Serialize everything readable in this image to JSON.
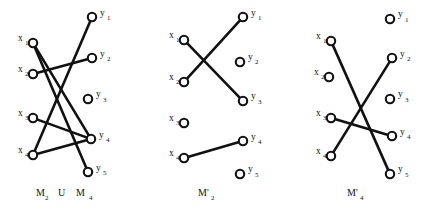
{
  "figure": {
    "background_color": "#ffffff",
    "ink_color": "#111111",
    "node_radius": 4.2,
    "panels": [
      {
        "id": "panel-union",
        "caption": "M",
        "caption_sub": "2",
        "caption_mid": "U",
        "caption2": "M",
        "caption2_sub": "4",
        "caption_full": "M2 U M4",
        "caption_x": 36,
        "caption_y": 196,
        "x_nodes": [
          {
            "label": "x",
            "sub": "1",
            "cx": 33,
            "cy": 43,
            "lx": 18,
            "ly": 41,
            "sx": 25,
            "sy": 45
          },
          {
            "label": "x",
            "sub": "2",
            "cx": 33,
            "cy": 74,
            "lx": 18,
            "ly": 72,
            "sx": 25,
            "sy": 76
          },
          {
            "label": "x",
            "sub": "3",
            "cx": 33,
            "cy": 118,
            "lx": 18,
            "ly": 116,
            "sx": 25,
            "sy": 120
          },
          {
            "label": "x",
            "sub": "4",
            "cx": 33,
            "cy": 155,
            "lx": 18,
            "ly": 153,
            "sx": 25,
            "sy": 157
          }
        ],
        "y_nodes": [
          {
            "label": "y",
            "sub": "1",
            "cx": 92,
            "cy": 17,
            "lx": 100,
            "ly": 16,
            "sx": 107,
            "sy": 20
          },
          {
            "label": "y",
            "sub": "2",
            "cx": 92,
            "cy": 58,
            "lx": 100,
            "ly": 57,
            "sx": 107,
            "sy": 61
          },
          {
            "label": "y",
            "sub": "3",
            "cx": 88,
            "cy": 99,
            "lx": 96,
            "ly": 97,
            "sx": 103,
            "sy": 102
          },
          {
            "label": "y",
            "sub": "4",
            "cx": 91,
            "cy": 139,
            "lx": 99,
            "ly": 138,
            "sx": 106,
            "sy": 142
          },
          {
            "label": "y",
            "sub": "5",
            "cx": 88,
            "cy": 172,
            "lx": 96,
            "ly": 171,
            "sx": 103,
            "sy": 175
          }
        ],
        "edges": [
          {
            "from": "x1",
            "to": "y4"
          },
          {
            "from": "x1",
            "to": "y5"
          },
          {
            "from": "x2",
            "to": "y2"
          },
          {
            "from": "x3",
            "to": "y4"
          },
          {
            "from": "x4",
            "to": "y1"
          },
          {
            "from": "x4",
            "to": "y4"
          }
        ]
      },
      {
        "id": "panel-m2-prime",
        "caption": "M'",
        "caption_sub": "2",
        "caption_mid": "",
        "caption2": "",
        "caption2_sub": "",
        "caption_full": "M'2",
        "caption_x": 198,
        "caption_y": 196,
        "x_nodes": [
          {
            "label": "x",
            "sub": "1",
            "cx": 184,
            "cy": 40,
            "lx": 169,
            "ly": 38,
            "sx": 176,
            "sy": 42
          },
          {
            "label": "x",
            "sub": "2",
            "cx": 184,
            "cy": 82,
            "lx": 169,
            "ly": 80,
            "sx": 176,
            "sy": 84
          },
          {
            "label": "x",
            "sub": "3",
            "cx": 184,
            "cy": 123,
            "lx": 169,
            "ly": 121,
            "sx": 176,
            "sy": 125
          },
          {
            "label": "x",
            "sub": "4",
            "cx": 184,
            "cy": 158,
            "lx": 169,
            "ly": 156,
            "sx": 176,
            "sy": 160
          }
        ],
        "y_nodes": [
          {
            "label": "y",
            "sub": "1",
            "cx": 243,
            "cy": 17,
            "lx": 251,
            "ly": 16,
            "sx": 258,
            "sy": 20
          },
          {
            "label": "y",
            "sub": "2",
            "cx": 240,
            "cy": 62,
            "lx": 248,
            "ly": 60,
            "sx": 255,
            "sy": 64
          },
          {
            "label": "y",
            "sub": "3",
            "cx": 243,
            "cy": 101,
            "lx": 251,
            "ly": 99,
            "sx": 258,
            "sy": 104
          },
          {
            "label": "y",
            "sub": "4",
            "cx": 243,
            "cy": 141,
            "lx": 251,
            "ly": 140,
            "sx": 258,
            "sy": 144
          },
          {
            "label": "y",
            "sub": "5",
            "cx": 240,
            "cy": 174,
            "lx": 248,
            "ly": 172,
            "sx": 255,
            "sy": 177
          }
        ],
        "edges": [
          {
            "from": "x1",
            "to": "y3"
          },
          {
            "from": "x2",
            "to": "y1"
          },
          {
            "from": "x4",
            "to": "y4"
          }
        ]
      },
      {
        "id": "panel-m4-prime",
        "caption": "M'",
        "caption_sub": "4",
        "caption_mid": "",
        "caption2": "",
        "caption2_sub": "",
        "caption_full": "M'4",
        "caption_x": 347,
        "caption_y": 196,
        "x_nodes": [
          {
            "label": "x",
            "sub": "1",
            "cx": 331,
            "cy": 41,
            "lx": 316,
            "ly": 39,
            "sx": 323,
            "sy": 43
          },
          {
            "label": "x",
            "sub": "2",
            "cx": 329,
            "cy": 77,
            "lx": 314,
            "ly": 75,
            "sx": 321,
            "sy": 79
          },
          {
            "label": "x",
            "sub": "3",
            "cx": 331,
            "cy": 118,
            "lx": 316,
            "ly": 116,
            "sx": 323,
            "sy": 120
          },
          {
            "label": "x",
            "sub": "4",
            "cx": 331,
            "cy": 156,
            "lx": 316,
            "ly": 154,
            "sx": 323,
            "sy": 158
          }
        ],
        "y_nodes": [
          {
            "label": "y",
            "sub": "1",
            "cx": 390,
            "cy": 19,
            "lx": 398,
            "ly": 17,
            "sx": 405,
            "sy": 22
          },
          {
            "label": "y",
            "sub": "2",
            "cx": 392,
            "cy": 58,
            "lx": 400,
            "ly": 57,
            "sx": 407,
            "sy": 61
          },
          {
            "label": "y",
            "sub": "3",
            "cx": 390,
            "cy": 99,
            "lx": 398,
            "ly": 97,
            "sx": 405,
            "sy": 102
          },
          {
            "label": "y",
            "sub": "4",
            "cx": 392,
            "cy": 136,
            "lx": 400,
            "ly": 135,
            "sx": 407,
            "sy": 139
          },
          {
            "label": "y",
            "sub": "5",
            "cx": 390,
            "cy": 174,
            "lx": 398,
            "ly": 172,
            "sx": 405,
            "sy": 177
          }
        ],
        "edges": [
          {
            "from": "x1",
            "to": "y5"
          },
          {
            "from": "x3",
            "to": "y4"
          },
          {
            "from": "x4",
            "to": "y2"
          }
        ]
      }
    ]
  }
}
